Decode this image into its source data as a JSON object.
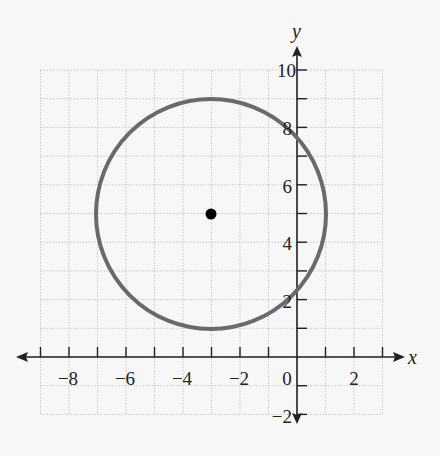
{
  "chart_data": {
    "type": "scatter",
    "title": "",
    "xlabel": "x",
    "ylabel": "y",
    "xlim": [
      -9,
      3
    ],
    "ylim": [
      -2,
      10
    ],
    "grid": true,
    "x_tick_labels": [
      "-8",
      "-6",
      "-4",
      "-2",
      "0",
      "2"
    ],
    "y_tick_labels": [
      "10",
      "8",
      "6",
      "4",
      "2",
      "-2"
    ],
    "shapes": [
      {
        "type": "circle",
        "center": [
          -3,
          5
        ],
        "radius": 4,
        "color": "#666666"
      }
    ],
    "points": [
      {
        "x": -3,
        "y": 5,
        "label": "center",
        "color": "#000000"
      }
    ]
  },
  "labels": {
    "x_axis": "x",
    "y_axis": "y",
    "xticks": [
      "−8",
      "−6",
      "−4",
      "−2",
      "0",
      "2"
    ],
    "yticks": [
      "10",
      "8",
      "6",
      "4",
      "2",
      "−2"
    ]
  }
}
